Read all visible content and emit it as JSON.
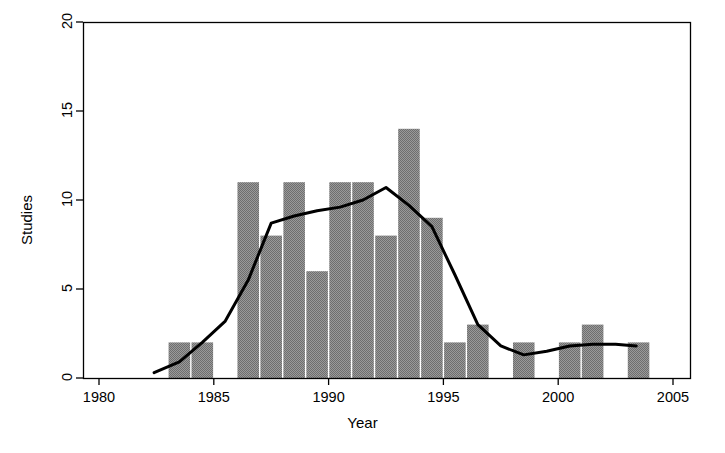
{
  "chart_data": {
    "type": "bar",
    "title": "",
    "subtitle": "",
    "xlabel": "Year",
    "ylabel": "Studies",
    "xlim": [
      1979.0,
      2005.5
    ],
    "ylim": [
      0,
      20
    ],
    "grid": false,
    "legend": null,
    "x_ticks": [
      1980,
      1985,
      1990,
      1995,
      2000,
      2005
    ],
    "x_tick_labels": [
      "1980",
      "1985",
      "1990",
      "1995",
      "2000",
      "2005"
    ],
    "y_ticks": [
      0,
      5,
      10,
      15,
      20
    ],
    "y_tick_labels": [
      "0",
      "5",
      "10",
      "15",
      "20"
    ],
    "bar_color": "#808080",
    "line_color": "#000000",
    "axis_color": "#000000",
    "categories": [
      1983,
      1984,
      1985,
      1986,
      1987,
      1988,
      1989,
      1990,
      1991,
      1992,
      1993,
      1994,
      1995,
      1996,
      1997,
      1998,
      1999,
      2000,
      2001,
      2002,
      2003
    ],
    "values": [
      2,
      2,
      0,
      11,
      8,
      11,
      6,
      11,
      11,
      8,
      14,
      9,
      2,
      3,
      0,
      2,
      0,
      2,
      3,
      0,
      2
    ],
    "series": [
      {
        "name": "Studies",
        "type": "bar",
        "values": [
          2,
          2,
          0,
          11,
          8,
          11,
          6,
          11,
          11,
          8,
          14,
          9,
          2,
          3,
          0,
          2,
          0,
          2,
          3,
          0,
          2
        ]
      },
      {
        "name": "Smoothed trend",
        "type": "line",
        "x": [
          1982.4,
          1983.5,
          1984.5,
          1985.5,
          1986.5,
          1987.5,
          1988.5,
          1989.5,
          1990.5,
          1991.5,
          1992.5,
          1993.5,
          1994.5,
          1995.5,
          1996.5,
          1997.5,
          1998.5,
          1999.5,
          2000.5,
          2001.5,
          2002.5,
          2003.4
        ],
        "y": [
          0.3,
          0.9,
          2.0,
          3.2,
          5.5,
          8.7,
          9.1,
          9.4,
          9.6,
          10.0,
          10.7,
          9.7,
          8.5,
          5.8,
          3.0,
          1.8,
          1.3,
          1.5,
          1.8,
          1.9,
          1.9,
          1.8
        ]
      }
    ]
  },
  "figure": {
    "background_color": "#ffffff",
    "frame_visible": true
  }
}
